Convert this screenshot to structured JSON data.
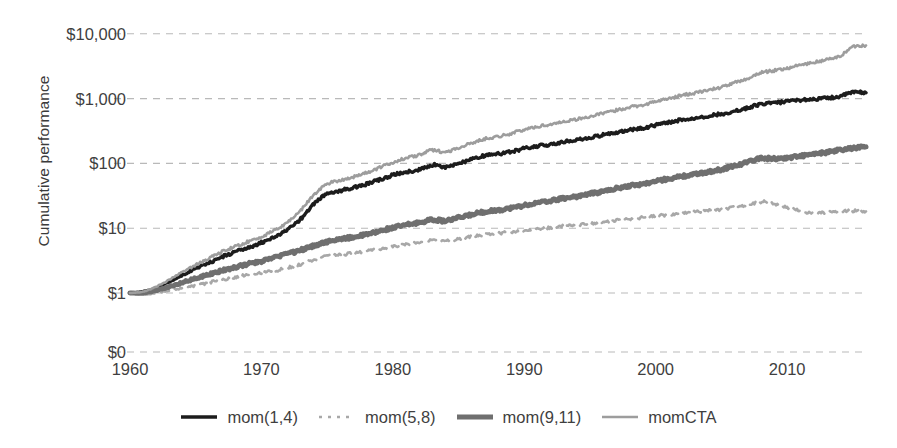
{
  "chart_data": {
    "type": "line",
    "title": "",
    "xlabel": "",
    "ylabel": "Cumulative performance",
    "yscale": "log",
    "grid": true,
    "legend_position": "bottom",
    "xlim": [
      1960,
      2016
    ],
    "xticks": [
      1960,
      1970,
      1980,
      1990,
      2000,
      2010
    ],
    "xtick_labels": [
      "1960",
      "1970",
      "1980",
      "1990",
      "2000",
      "2010"
    ],
    "yticks": [
      0,
      1,
      10,
      100,
      1000,
      10000
    ],
    "ytick_labels": [
      "$0",
      "$1",
      "$10",
      "$100",
      "$1,000",
      "$10,000"
    ],
    "series": [
      {
        "name": "mom(1,4)",
        "color": "#1c1c1c",
        "style": "solid",
        "width": 3.4,
        "x": [
          1960,
          1961,
          1962,
          1963,
          1964,
          1965,
          1966,
          1967,
          1968,
          1969,
          1970,
          1971,
          1972,
          1973,
          1974,
          1975,
          1976,
          1977,
          1978,
          1979,
          1980,
          1981,
          1982,
          1983,
          1984,
          1985,
          1986,
          1987,
          1988,
          1989,
          1990,
          1991,
          1992,
          1993,
          1994,
          1995,
          1996,
          1997,
          1998,
          1999,
          2000,
          2001,
          2002,
          2003,
          2004,
          2005,
          2006,
          2007,
          2008,
          2009,
          2010,
          2011,
          2012,
          2013,
          2014,
          2015,
          2016
        ],
        "y": [
          1.0,
          1.05,
          1.2,
          1.5,
          1.9,
          2.4,
          2.9,
          3.6,
          4.3,
          5.0,
          6.0,
          7.3,
          9.5,
          14.0,
          24.0,
          34.0,
          38.0,
          42.0,
          48.0,
          56.0,
          66.0,
          74.0,
          80.0,
          95.0,
          88.0,
          100.0,
          115.0,
          132.0,
          140.0,
          152.0,
          170.0,
          185.0,
          196.0,
          215.0,
          230.0,
          250.0,
          275.0,
          300.0,
          330.0,
          350.0,
          390.0,
          430.0,
          470.0,
          500.0,
          540.0,
          580.0,
          640.0,
          720.0,
          820.0,
          860.0,
          900.0,
          950.0,
          980.0,
          1020.0,
          1080.0,
          1250.0,
          1230.0
        ]
      },
      {
        "name": "mom(5,8)",
        "color": "#a8a8a8",
        "style": "dashed",
        "width": 2.6,
        "x": [
          1960,
          1961,
          1962,
          1963,
          1964,
          1965,
          1966,
          1967,
          1968,
          1969,
          1970,
          1971,
          1972,
          1973,
          1974,
          1975,
          1976,
          1977,
          1978,
          1979,
          1980,
          1981,
          1982,
          1983,
          1984,
          1985,
          1986,
          1987,
          1988,
          1989,
          1990,
          1991,
          1992,
          1993,
          1994,
          1995,
          1996,
          1997,
          1998,
          1999,
          2000,
          2001,
          2002,
          2003,
          2004,
          2005,
          2006,
          2007,
          2008,
          2009,
          2010,
          2011,
          2012,
          2013,
          2014,
          2015,
          2016
        ],
        "y": [
          1.0,
          0.95,
          1.0,
          1.1,
          1.2,
          1.3,
          1.45,
          1.6,
          1.75,
          1.9,
          2.05,
          2.2,
          2.45,
          2.8,
          3.3,
          3.7,
          3.9,
          4.1,
          4.4,
          4.8,
          5.2,
          5.6,
          6.1,
          6.6,
          6.3,
          6.8,
          7.4,
          8.0,
          8.3,
          8.7,
          9.2,
          9.7,
          10.2,
          10.8,
          11.2,
          11.8,
          12.4,
          13.2,
          14.0,
          14.6,
          15.4,
          16.2,
          17.0,
          17.8,
          18.6,
          19.5,
          21.0,
          23.0,
          25.5,
          24.0,
          21.0,
          18.5,
          17.0,
          17.5,
          18.0,
          18.5,
          18.2
        ]
      },
      {
        "name": "mom(9,11)",
        "color": "#6f6f6f",
        "style": "solid",
        "width": 5.0,
        "x": [
          1960,
          1961,
          1962,
          1963,
          1964,
          1965,
          1966,
          1967,
          1968,
          1969,
          1970,
          1971,
          1972,
          1973,
          1974,
          1975,
          1976,
          1977,
          1978,
          1979,
          1980,
          1981,
          1982,
          1983,
          1984,
          1985,
          1986,
          1987,
          1988,
          1989,
          1990,
          1991,
          1992,
          1993,
          1994,
          1995,
          1996,
          1997,
          1998,
          1999,
          2000,
          2001,
          2002,
          2003,
          2004,
          2005,
          2006,
          2007,
          2008,
          2009,
          2010,
          2011,
          2012,
          2013,
          2014,
          2015,
          2016
        ],
        "y": [
          1.0,
          1.0,
          1.1,
          1.25,
          1.45,
          1.7,
          1.95,
          2.2,
          2.5,
          2.8,
          3.1,
          3.5,
          4.0,
          4.6,
          5.4,
          6.2,
          6.7,
          7.3,
          8.0,
          9.0,
          10.2,
          11.2,
          12.2,
          13.5,
          13.0,
          14.5,
          16.2,
          18.0,
          19.0,
          20.5,
          22.5,
          24.5,
          26.5,
          29.0,
          31.0,
          34.0,
          37.0,
          41.0,
          45.0,
          48.0,
          53.0,
          58.0,
          63.0,
          68.0,
          74.0,
          81.0,
          92.0,
          105.0,
          120.0,
          118.0,
          122.0,
          130.0,
          138.0,
          148.0,
          160.0,
          172.0,
          180.0
        ]
      },
      {
        "name": "momCTA",
        "color": "#9d9d9d",
        "style": "solid",
        "width": 2.6,
        "x": [
          1960,
          1961,
          1962,
          1963,
          1964,
          1965,
          1966,
          1967,
          1968,
          1969,
          1970,
          1971,
          1972,
          1973,
          1974,
          1975,
          1976,
          1977,
          1978,
          1979,
          1980,
          1981,
          1982,
          1983,
          1984,
          1985,
          1986,
          1987,
          1988,
          1989,
          1990,
          1991,
          1992,
          1993,
          1994,
          1995,
          1996,
          1997,
          1998,
          1999,
          2000,
          2001,
          2002,
          2003,
          2004,
          2005,
          2006,
          2007,
          2008,
          2009,
          2010,
          2011,
          2012,
          2013,
          2014,
          2015,
          2016
        ],
        "y": [
          1.0,
          1.05,
          1.25,
          1.6,
          2.1,
          2.7,
          3.4,
          4.3,
          5.2,
          6.2,
          7.4,
          9.2,
          12.5,
          19.0,
          33.0,
          48.0,
          55.0,
          62.0,
          72.0,
          86.0,
          104.0,
          120.0,
          135.0,
          160.0,
          150.0,
          175.0,
          205.0,
          240.0,
          260.0,
          290.0,
          330.0,
          370.0,
          400.0,
          445.0,
          480.0,
          530.0,
          590.0,
          660.0,
          740.0,
          800.0,
          900.0,
          1000.0,
          1120.0,
          1230.0,
          1350.0,
          1500.0,
          1750.0,
          2050.0,
          2500.0,
          2700.0,
          2950.0,
          3300.0,
          3600.0,
          4000.0,
          4500.0,
          6300.0,
          6600.0
        ]
      }
    ]
  },
  "axis": {
    "y_title": "Cumulative performance"
  },
  "legend": {
    "items": [
      {
        "label": "mom(1,4)"
      },
      {
        "label": "mom(5,8)"
      },
      {
        "label": "mom(9,11)"
      },
      {
        "label": "momCTA"
      }
    ]
  }
}
